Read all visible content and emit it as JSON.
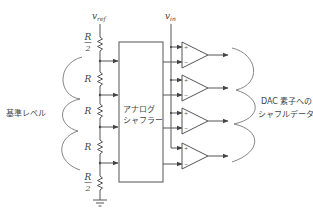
{
  "diagram": {
    "vref_label": {
      "main": "v",
      "sub": "ref"
    },
    "vin_label": {
      "main": "v",
      "sub": "in"
    },
    "resistors": [
      {
        "num": "R",
        "den": "2"
      },
      {
        "num": "R"
      },
      {
        "num": "R"
      },
      {
        "num": "R"
      },
      {
        "num": "R",
        "den": "2"
      }
    ],
    "shuffler": {
      "line1": "アナログ",
      "line2": "シャフラー"
    },
    "left_label": "基準レベル",
    "right_label": {
      "line1": "DAC 素子への",
      "line2": "シャフルデータ"
    },
    "comparators": [
      {
        "plus": "+",
        "minus": "−"
      },
      {
        "plus": "+",
        "minus": "−"
      },
      {
        "plus": "+",
        "minus": "−"
      },
      {
        "plus": "+",
        "minus": "−"
      }
    ],
    "colors": {
      "line": "#555555",
      "text": "#444444",
      "background": "#ffffff"
    }
  }
}
